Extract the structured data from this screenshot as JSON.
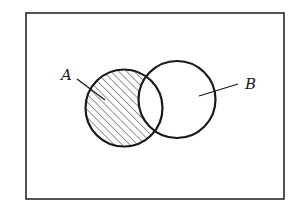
{
  "diagram": {
    "type": "venn",
    "universe": {
      "x": 26,
      "y": 13,
      "width": 258,
      "height": 186,
      "stroke": "#2a2a2a",
      "stroke_width": 1.6
    },
    "sets": [
      {
        "id": "A",
        "label": "A",
        "cx": 124,
        "cy": 108,
        "r": 38.5,
        "label_pos": {
          "x": 61,
          "y": 80
        },
        "leader": {
          "x1": 77,
          "y1": 79,
          "x2": 105,
          "y2": 100
        }
      },
      {
        "id": "B",
        "label": "B",
        "cx": 177,
        "cy": 99.5,
        "r": 38.5,
        "label_pos": {
          "x": 245,
          "y": 89
        },
        "leader": {
          "x1": 238,
          "y1": 84,
          "x2": 199,
          "y2": 96
        }
      }
    ],
    "shaded_region": "A - B",
    "hatch": {
      "angle_deg": 45,
      "spacing": 5.5,
      "stroke": "#2a2a2a",
      "stroke_width": 1
    },
    "circle_stroke": "#1a1a1a",
    "circle_stroke_width": 2.2
  }
}
